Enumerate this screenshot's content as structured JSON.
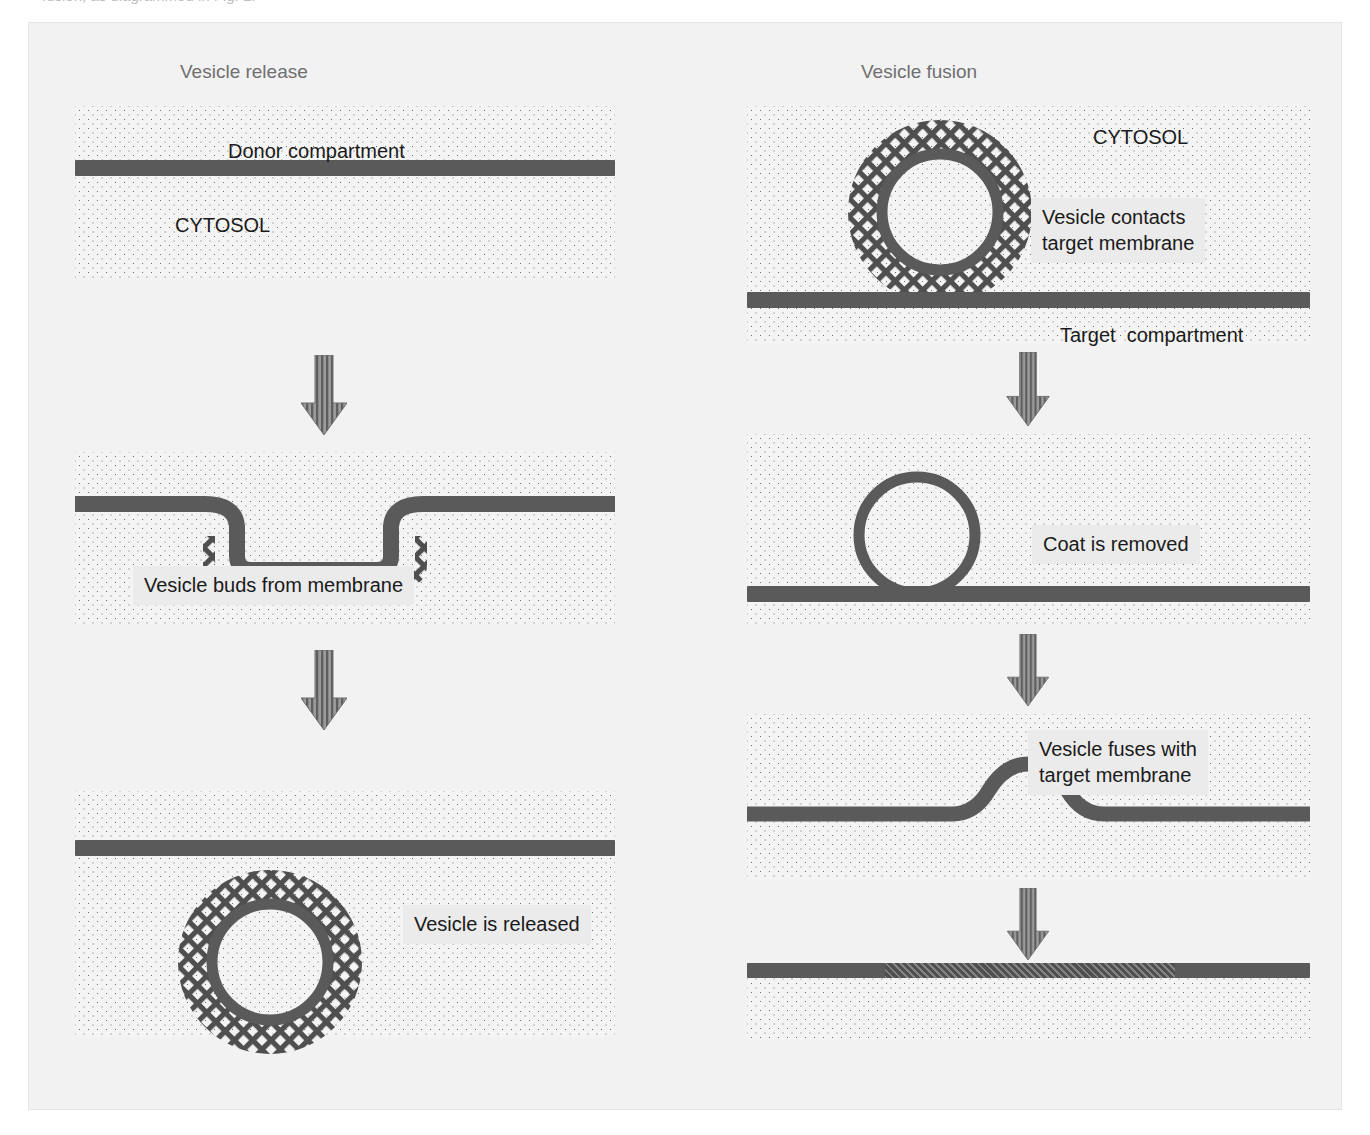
{
  "caption": {
    "text": "fusion, as diagrammed in Fig. 1."
  },
  "headings": {
    "left": "Vesicle release",
    "right": "Vesicle fusion"
  },
  "colors": {
    "page_background": "#ffffff",
    "frame_background": "#f2f2f2",
    "frame_border": "#e4e4e4",
    "panel_background": "#f4f4f4",
    "stipple_dot": "#6b6b6b",
    "membrane": "#5a5a5a",
    "coat": "#4f4f4f",
    "label_box": "#ebebeb",
    "label_text": "#1a1a1a",
    "heading_text": "#6f6f6f",
    "arrow": "#6e6e6e"
  },
  "left_column": {
    "title": "Vesicle release",
    "steps": [
      {
        "id": "donor-membrane-flat",
        "labels": [
          {
            "text": "Donor compartment",
            "style": "plain"
          },
          {
            "text": "CYTOSOL",
            "style": "plain"
          }
        ]
      },
      {
        "id": "vesicle-budding",
        "labels": [
          {
            "text": "Vesicle buds from membrane",
            "style": "boxed"
          }
        ]
      },
      {
        "id": "vesicle-released",
        "labels": [
          {
            "text": "Vesicle is released",
            "style": "boxed"
          }
        ]
      }
    ]
  },
  "right_column": {
    "title": "Vesicle fusion",
    "steps": [
      {
        "id": "vesicle-contacts-target",
        "labels": [
          {
            "text": "CYTOSOL",
            "style": "plain"
          },
          {
            "text": "Vesicle contacts",
            "style": "boxed"
          },
          {
            "text": "target membrane",
            "style": "boxed"
          },
          {
            "text": "Target  compartment",
            "style": "plain"
          }
        ]
      },
      {
        "id": "coat-removed",
        "labels": [
          {
            "text": "Coat is removed",
            "style": "boxed"
          }
        ]
      },
      {
        "id": "vesicle-fuses",
        "labels": [
          {
            "text": "Vesicle fuses with",
            "style": "boxed"
          },
          {
            "text": "target membrane",
            "style": "boxed"
          }
        ]
      },
      {
        "id": "membrane-incorporated",
        "labels": []
      }
    ]
  },
  "arrows": {
    "direction": "down",
    "style": "striped",
    "left_count": 2,
    "right_count": 3
  }
}
